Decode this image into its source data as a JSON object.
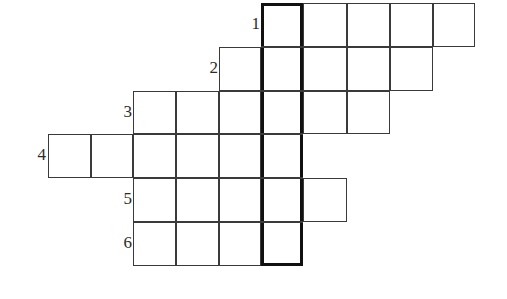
{
  "puzzle": {
    "title": "Crossword Grid",
    "type": "staircase-crossword-grid",
    "geometry": {
      "cell_width": 43,
      "cell_height": 44,
      "origin_x": 48,
      "origin_y": 3,
      "columns": 10,
      "rows": 6,
      "column_x": [
        48,
        91,
        133,
        176,
        219,
        261,
        303,
        347,
        390,
        433,
        475
      ],
      "row_y": [
        3,
        47,
        91,
        134,
        178,
        222,
        266
      ]
    },
    "rows": [
      {
        "number": "1",
        "label_x": 238,
        "label_y": 15,
        "start_col": 5,
        "cell_count": 5
      },
      {
        "number": "2",
        "label_x": 196,
        "label_y": 59,
        "start_col": 4,
        "cell_count": 5
      },
      {
        "number": "3",
        "label_x": 110,
        "label_y": 103,
        "start_col": 2,
        "cell_count": 6
      },
      {
        "number": "4",
        "label_x": 24,
        "label_y": 146,
        "start_col": 0,
        "cell_count": 6
      },
      {
        "number": "5",
        "label_x": 110,
        "label_y": 190,
        "start_col": 2,
        "cell_count": 5
      },
      {
        "number": "6",
        "label_x": 110,
        "label_y": 234,
        "start_col": 2,
        "cell_count": 4
      }
    ],
    "highlight": {
      "name": "bold-answer-column",
      "column_index": 5,
      "from_row": 1,
      "to_row": 6
    },
    "colors": {
      "background": "#ffffff",
      "grid_line": "#3a3a3a",
      "bold_line": "#111111",
      "label_text": "#2b2b2b"
    }
  }
}
